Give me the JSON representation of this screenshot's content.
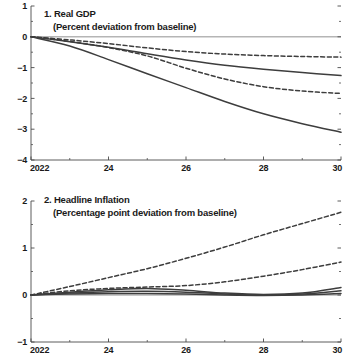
{
  "figure": {
    "background": "#ffffff",
    "line_color": "#3d3d3d",
    "axis_color": "#4a4a4a",
    "zero_line_color": "#b5b5b5"
  },
  "panel1": {
    "number": "1.",
    "title": "1. Real GDP",
    "subtitle": "(Percent deviation from baseline)",
    "y_ticks": [
      "1",
      "0",
      "−1",
      "−2",
      "−3",
      "−4"
    ],
    "x_ticks": [
      "2022",
      "24",
      "26",
      "28",
      "30"
    ]
  },
  "panel2": {
    "number": "2.",
    "title": "2. Headline Inflation",
    "subtitle": "(Percentage point deviation from baseline)",
    "y_ticks": [
      "2",
      "1",
      "0",
      "−1"
    ],
    "x_ticks": [
      "2022",
      "24",
      "26",
      "28",
      "30"
    ]
  },
  "chart_data": [
    {
      "type": "line",
      "title": "1. Real GDP",
      "subtitle": "(Percent deviation from baseline)",
      "xlabel": "",
      "ylabel": "Percent deviation from baseline",
      "xlim": [
        2022,
        2030
      ],
      "ylim": [
        -4,
        1
      ],
      "yticks": [
        1,
        0,
        -1,
        -2,
        -3,
        -4
      ],
      "xticks": [
        2022,
        2024,
        2026,
        2028,
        2030
      ],
      "minor_xticks": [
        2023,
        2025,
        2027,
        2029
      ],
      "grid": false,
      "legend": "none",
      "zero_line": true,
      "x": [
        2022,
        2023,
        2024,
        2025,
        2026,
        2027,
        2028,
        2029,
        2030
      ],
      "series": [
        {
          "name": "series-1-dashed-upper",
          "style": "dashed",
          "values": [
            0.0,
            -0.1,
            -0.22,
            -0.36,
            -0.48,
            -0.56,
            -0.61,
            -0.64,
            -0.66
          ]
        },
        {
          "name": "series-2-solid-upper",
          "style": "solid",
          "values": [
            0.0,
            -0.16,
            -0.34,
            -0.55,
            -0.75,
            -0.92,
            -1.05,
            -1.16,
            -1.26
          ]
        },
        {
          "name": "series-3-dashed-lower",
          "style": "dashed",
          "values": [
            0.0,
            -0.15,
            -0.35,
            -0.62,
            -1.02,
            -1.37,
            -1.62,
            -1.76,
            -1.84
          ]
        },
        {
          "name": "series-4-solid-lower",
          "style": "solid",
          "values": [
            0.0,
            -0.3,
            -0.74,
            -1.2,
            -1.65,
            -2.1,
            -2.5,
            -2.82,
            -3.1
          ]
        }
      ]
    },
    {
      "type": "line",
      "title": "2. Headline Inflation",
      "subtitle": "(Percentage point deviation from baseline)",
      "xlabel": "",
      "ylabel": "Percentage point deviation from baseline",
      "xlim": [
        2022,
        2030
      ],
      "ylim": [
        -1,
        2
      ],
      "yticks": [
        2,
        1,
        0,
        -1
      ],
      "xticks": [
        2022,
        2024,
        2026,
        2028,
        2030
      ],
      "minor_xticks": [
        2023,
        2025,
        2027,
        2029
      ],
      "grid": false,
      "legend": "none",
      "zero_line": true,
      "x": [
        2022,
        2023,
        2024,
        2025,
        2026,
        2027,
        2028,
        2029,
        2030
      ],
      "series": [
        {
          "name": "series-1-dashed-upper",
          "style": "dashed",
          "values": [
            0.0,
            0.18,
            0.37,
            0.56,
            0.78,
            1.02,
            1.28,
            1.52,
            1.76
          ]
        },
        {
          "name": "series-2-dashed-lower",
          "style": "dashed",
          "values": [
            0.0,
            0.09,
            0.14,
            0.17,
            0.2,
            0.28,
            0.4,
            0.54,
            0.7
          ]
        },
        {
          "name": "series-3-solid-upper",
          "style": "solid",
          "values": [
            0.0,
            0.06,
            0.11,
            0.14,
            0.1,
            0.04,
            0.01,
            0.04,
            0.16
          ]
        },
        {
          "name": "series-4-solid-lower",
          "style": "solid",
          "values": [
            0.0,
            0.04,
            0.07,
            0.08,
            0.06,
            0.02,
            0.0,
            0.02,
            0.09
          ]
        },
        {
          "name": "series-5-solid-flat",
          "style": "solid",
          "values": [
            0.0,
            0.02,
            0.03,
            0.03,
            0.02,
            0.0,
            -0.01,
            0.0,
            0.03
          ]
        }
      ]
    }
  ]
}
